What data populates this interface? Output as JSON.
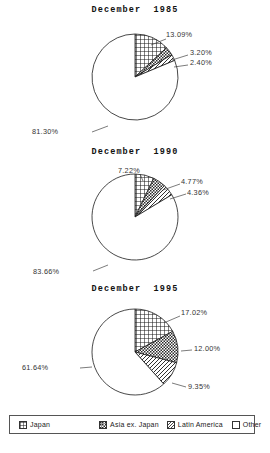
{
  "charts": [
    {
      "title": "December  1985",
      "labels": [
        "13.09%",
        "3.20%",
        "2.40%",
        "81.30%"
      ]
    },
    {
      "title": "December  1990",
      "labels": [
        "7.22%",
        "4.77%",
        "4.36%",
        "83.66%"
      ]
    },
    {
      "title": "December  1995",
      "labels": [
        "17.02%",
        "12.00%",
        "9.35%",
        "61.64%"
      ]
    }
  ],
  "legend": {
    "items": [
      {
        "label": "Japan",
        "pattern": "cross-hatch"
      },
      {
        "label": "Asia ex. Japan",
        "pattern": "checker"
      },
      {
        "label": "Latin America",
        "pattern": "diagonal"
      },
      {
        "label": "Other",
        "pattern": "empty"
      }
    ]
  },
  "chart_data": [
    {
      "type": "pie",
      "title": "December  1985",
      "categories": [
        "Japan",
        "Asia ex. Japan",
        "Latin America",
        "Other"
      ],
      "values": [
        13.09,
        3.2,
        2.4,
        81.3
      ],
      "data_labels": [
        "13.09%",
        "3.20%",
        "2.40%",
        "81.30%"
      ],
      "start_angle": 90,
      "direction": "clockwise",
      "legend_position": "bottom",
      "units": "percent"
    },
    {
      "type": "pie",
      "title": "December  1990",
      "categories": [
        "Japan",
        "Asia ex. Japan",
        "Latin America",
        "Other"
      ],
      "values": [
        7.22,
        4.77,
        4.36,
        83.66
      ],
      "data_labels": [
        "7.22%",
        "4.77%",
        "4.36%",
        "83.66%"
      ],
      "start_angle": 90,
      "direction": "clockwise",
      "legend_position": "bottom",
      "units": "percent"
    },
    {
      "type": "pie",
      "title": "December  1995",
      "categories": [
        "Japan",
        "Asia ex. Japan",
        "Latin America",
        "Other"
      ],
      "values": [
        17.02,
        12.0,
        9.35,
        61.64
      ],
      "data_labels": [
        "17.02%",
        "12.00%",
        "9.35%",
        "61.64%"
      ],
      "start_angle": 90,
      "direction": "clockwise",
      "legend_position": "bottom",
      "units": "percent"
    }
  ]
}
